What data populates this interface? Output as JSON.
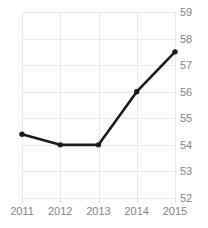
{
  "chart_data": {
    "type": "line",
    "title": "",
    "title_note": "title clipped off top edge of screenshot",
    "xlabel": "",
    "ylabel": "",
    "categories": [
      "2011",
      "2012",
      "2013",
      "2014",
      "2015"
    ],
    "values": [
      54.4,
      54.0,
      54.0,
      56.0,
      57.5
    ],
    "series": [
      {
        "name": "series-1",
        "values": [
          54.4,
          54.0,
          54.0,
          56.0,
          57.5
        ],
        "color": "#1a1a1a",
        "marker": "circle"
      }
    ],
    "ylim": [
      52,
      59
    ],
    "yticks": [
      52,
      53,
      54,
      55,
      56,
      57,
      58,
      59
    ],
    "ytick_labels": [
      "52",
      "53",
      "54",
      "55",
      "56",
      "57",
      "58",
      "59"
    ],
    "xticks": [
      "2011",
      "2012",
      "2013",
      "2014",
      "2015"
    ],
    "y_axis_position": "right",
    "grid": true,
    "grid_color": "#e9eaec",
    "legend": false,
    "legend_position": "none",
    "tick_label_color": "#83858a",
    "background": "#ffffff"
  }
}
